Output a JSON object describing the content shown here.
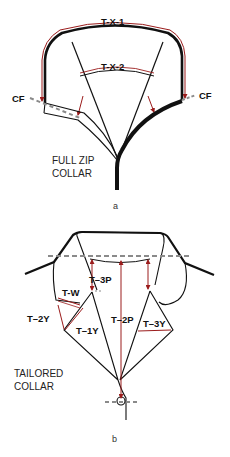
{
  "figure_a": {
    "caption": "a",
    "title_line1": "FULL ZIP",
    "title_line2": "COLLAR",
    "labels": {
      "tx1": "T-X-1",
      "tx2": "T-X-2",
      "cf_left": "CF",
      "cf_right": "CF"
    }
  },
  "figure_b": {
    "caption": "b",
    "title_line1": "TAILORED",
    "title_line2": "COLLAR",
    "labels": {
      "t3p": "T–3P",
      "tw": "T-W",
      "t2y": "T–2Y",
      "t1y": "T–1Y",
      "t2p": "T–2P",
      "t3y": "T–3Y"
    }
  },
  "colors": {
    "outline": "#111111",
    "measure": "#9b1c1c",
    "guide": "#8a8a8a"
  }
}
